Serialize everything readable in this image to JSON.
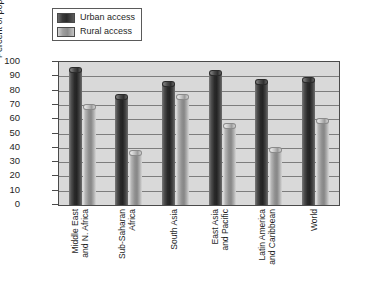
{
  "chart_data": {
    "type": "bar",
    "title": "",
    "xlabel": "",
    "ylabel": "Percent of population",
    "ylim": [
      0,
      100
    ],
    "ytick_step": 10,
    "yticks": [
      100,
      90,
      80,
      70,
      60,
      50,
      40,
      30,
      20,
      10,
      0
    ],
    "grid": true,
    "legend_position": "top-left",
    "categories": [
      "Middle East and N. Africa",
      "Sub-Saharan Africa",
      "South Asia",
      "East Asia and Pacific",
      "Latin America and Caribbean",
      "World"
    ],
    "category_lines": [
      [
        "Middle East",
        "and N. Africa"
      ],
      [
        "Sub-Saharan",
        "Africa"
      ],
      [
        "South Asia"
      ],
      [
        "East Asia",
        "and Pacific"
      ],
      [
        "Latin America",
        "and Caribbean"
      ],
      [
        "World"
      ]
    ],
    "series": [
      {
        "name": "Urban access",
        "color": "#2b2b2b",
        "values": [
          97,
          78,
          87,
          95,
          89,
          90
        ]
      },
      {
        "name": "Rural access",
        "color": "#9e9e9e",
        "values": [
          71,
          39,
          78,
          58,
          41,
          61
        ]
      }
    ]
  },
  "legend": {
    "items": [
      {
        "label": "Urban access",
        "swatch": "urban"
      },
      {
        "label": "Rural access",
        "swatch": "rural"
      }
    ]
  },
  "axis": {
    "y_title": "Percent of population"
  },
  "caption": {
    "text": ""
  }
}
